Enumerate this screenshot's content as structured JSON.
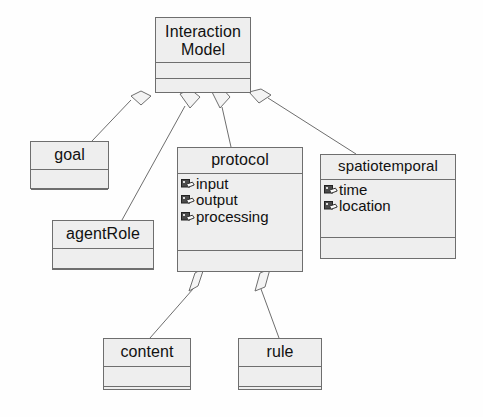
{
  "diagram": {
    "type": "uml-class-diagram",
    "title": "Interaction Model",
    "background_color": "#fefefe",
    "box_fill_color": "#eeeeee",
    "line_color": "#6e6e6e",
    "text_color": "#111111",
    "relationship_type": "aggregation",
    "classes": [
      {
        "id": "interaction-model",
        "name": "Interaction\nModel",
        "attributes": [],
        "operations": []
      },
      {
        "id": "goal",
        "name": "goal",
        "attributes": [],
        "operations": []
      },
      {
        "id": "agent-role",
        "name": "agentRole",
        "attributes": [],
        "operations": []
      },
      {
        "id": "protocol",
        "name": "protocol",
        "attributes": [
          {
            "icon": "attribute-icon",
            "label": "input"
          },
          {
            "icon": "attribute-icon",
            "label": "output"
          },
          {
            "icon": "attribute-icon",
            "label": "processing"
          }
        ],
        "operations": []
      },
      {
        "id": "spatiotemporal",
        "name": "spatiotemporal",
        "attributes": [
          {
            "icon": "attribute-icon",
            "label": "time"
          },
          {
            "icon": "attribute-icon",
            "label": "location"
          }
        ],
        "operations": []
      },
      {
        "id": "content",
        "name": "content",
        "attributes": [],
        "operations": []
      },
      {
        "id": "rule",
        "name": "rule",
        "attributes": [],
        "operations": []
      }
    ],
    "relationships": [
      {
        "from": "interaction-model",
        "to": "goal",
        "kind": "aggregation"
      },
      {
        "from": "interaction-model",
        "to": "agent-role",
        "kind": "aggregation"
      },
      {
        "from": "interaction-model",
        "to": "protocol",
        "kind": "aggregation"
      },
      {
        "from": "interaction-model",
        "to": "spatiotemporal",
        "kind": "aggregation"
      },
      {
        "from": "protocol",
        "to": "content",
        "kind": "aggregation"
      },
      {
        "from": "protocol",
        "to": "rule",
        "kind": "aggregation"
      }
    ]
  }
}
